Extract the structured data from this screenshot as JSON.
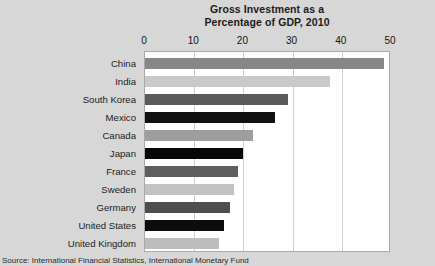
{
  "chart_data": {
    "type": "bar",
    "orientation": "horizontal",
    "title": "Gross Investment as a Percentage of GDP, 2010",
    "title_lines": [
      "Gross Investment as a",
      "Percentage of GDP, 2010"
    ],
    "xlabel": "",
    "ylabel": "",
    "xlim": [
      0,
      50
    ],
    "xticks": [
      0,
      10,
      20,
      30,
      40,
      50
    ],
    "xtick_labels": [
      "0",
      "10",
      "20",
      "30",
      "40",
      "50"
    ],
    "grid": true,
    "grid_axis": "x",
    "legend": false,
    "categories": [
      "China",
      "India",
      "South Korea",
      "Mexico",
      "Canada",
      "Japan",
      "France",
      "Sweden",
      "Germany",
      "United States",
      "United Kingdom"
    ],
    "values": [
      48.6,
      37.7,
      29.0,
      26.4,
      22.0,
      20.0,
      19.0,
      18.0,
      17.3,
      16.0,
      15.0
    ],
    "bar_colors": [
      "#878787",
      "#c9c9c9",
      "#5a5a5a",
      "#111111",
      "#9e9e9e",
      "#070707",
      "#5e5e5e",
      "#c2c2c2",
      "#4e4e4e",
      "#0d0d0d",
      "#bdbdbd"
    ]
  },
  "source": {
    "text": "Source: International Financial Statistics, International Monetary Fund"
  },
  "colors": {
    "background": "#d7d7d7",
    "plot_background": "#ffffff",
    "plot_border": "#a9a9a9",
    "gridline": "#cfcfcf",
    "text": "#1b1b1b"
  }
}
